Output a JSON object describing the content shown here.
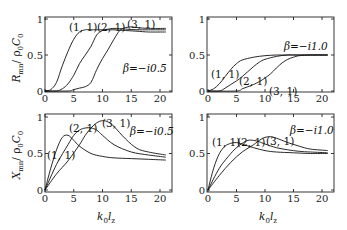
{
  "chart_data": [
    {
      "type": "line",
      "panel": "top-left",
      "ylabel": "R_mn / ρ0 C0",
      "xlabel": "",
      "annotation": "β=−i0.5",
      "xlim": [
        0,
        21
      ],
      "ylim": [
        0,
        1.05
      ],
      "xticks": [
        "0",
        "5",
        "10",
        "15",
        "20"
      ],
      "yticks": [
        "0",
        "0.5",
        "1"
      ],
      "series": [
        {
          "name": "(1, 1)",
          "x": [
            0,
            1,
            2,
            3,
            4,
            5,
            6,
            7,
            8,
            10,
            12,
            14,
            16,
            18,
            21
          ],
          "y": [
            0,
            0.02,
            0.12,
            0.35,
            0.55,
            0.72,
            0.82,
            0.85,
            0.85,
            0.85,
            0.85,
            0.84,
            0.83,
            0.82,
            0.82
          ]
        },
        {
          "name": "(2, 1)",
          "x": [
            0,
            2,
            3,
            4,
            5,
            6,
            7,
            8,
            9,
            10,
            11,
            12,
            14,
            16,
            18,
            21
          ],
          "y": [
            0,
            0,
            0.03,
            0.1,
            0.22,
            0.38,
            0.5,
            0.62,
            0.78,
            0.84,
            0.86,
            0.87,
            0.86,
            0.85,
            0.85,
            0.85
          ]
        },
        {
          "name": "(3, 1)",
          "x": [
            0,
            4,
            5,
            6,
            7,
            8,
            9,
            10,
            11,
            12,
            13,
            14,
            15,
            16,
            18,
            21
          ],
          "y": [
            0,
            0,
            0.02,
            0.04,
            0.06,
            0.12,
            0.3,
            0.45,
            0.58,
            0.72,
            0.84,
            0.88,
            0.89,
            0.88,
            0.87,
            0.87
          ]
        }
      ]
    },
    {
      "type": "line",
      "panel": "top-right",
      "ylabel": "",
      "xlabel": "",
      "annotation": "β=−i1.0",
      "xlim": [
        0,
        21
      ],
      "ylim": [
        0,
        1.05
      ],
      "xticks": [
        "0",
        "5",
        "10",
        "15",
        "20"
      ],
      "yticks": [
        "0",
        "0.5",
        "1"
      ],
      "series": [
        {
          "name": "(1, 1)",
          "x": [
            0,
            1,
            2,
            3,
            4,
            5,
            6,
            8,
            10,
            12,
            14,
            16,
            18,
            21
          ],
          "y": [
            0,
            0.03,
            0.1,
            0.2,
            0.3,
            0.38,
            0.43,
            0.47,
            0.49,
            0.5,
            0.5,
            0.5,
            0.5,
            0.5
          ]
        },
        {
          "name": "(2, 1)",
          "x": [
            0,
            2,
            3,
            4,
            5,
            6,
            7,
            8,
            9,
            10,
            12,
            14,
            16,
            21
          ],
          "y": [
            0,
            0,
            0.04,
            0.09,
            0.14,
            0.2,
            0.27,
            0.34,
            0.4,
            0.44,
            0.48,
            0.5,
            0.5,
            0.5
          ]
        },
        {
          "name": "(3, 1)",
          "x": [
            0,
            5,
            6,
            7,
            8,
            9,
            10,
            11,
            12,
            13,
            14,
            15,
            16,
            18,
            21
          ],
          "y": [
            0,
            0,
            0.03,
            0.06,
            0.09,
            0.13,
            0.18,
            0.24,
            0.32,
            0.39,
            0.44,
            0.47,
            0.49,
            0.5,
            0.5
          ]
        }
      ]
    },
    {
      "type": "line",
      "panel": "bottom-left",
      "ylabel": "X_mn / ρ0 C0",
      "xlabel": "k0 lz",
      "annotation": "β=−i0.5",
      "xlim": [
        0,
        21
      ],
      "ylim": [
        0,
        1.05
      ],
      "xticks": [
        "0",
        "5",
        "10",
        "15",
        "20"
      ],
      "yticks": [
        "0",
        "0.5",
        "1"
      ],
      "series": [
        {
          "name": "(1, 1)",
          "x": [
            0,
            1,
            2,
            3,
            4,
            5,
            6,
            8,
            10,
            12,
            15,
            18,
            21
          ],
          "y": [
            0,
            0.3,
            0.55,
            0.72,
            0.75,
            0.68,
            0.6,
            0.5,
            0.46,
            0.44,
            0.43,
            0.42,
            0.41
          ]
        },
        {
          "name": "(2, 1)",
          "x": [
            0,
            2,
            4,
            5,
            6,
            7,
            8,
            9,
            10,
            12,
            15,
            18,
            21
          ],
          "y": [
            0,
            0.35,
            0.62,
            0.75,
            0.82,
            0.85,
            0.85,
            0.82,
            0.75,
            0.62,
            0.52,
            0.48,
            0.45
          ]
        },
        {
          "name": "(3, 1)",
          "x": [
            0,
            2,
            4,
            6,
            7,
            8,
            9,
            10,
            11,
            12,
            14,
            16,
            18,
            21
          ],
          "y": [
            0,
            0.22,
            0.4,
            0.62,
            0.75,
            0.85,
            0.92,
            0.95,
            0.93,
            0.87,
            0.7,
            0.57,
            0.52,
            0.48
          ]
        }
      ]
    },
    {
      "type": "line",
      "panel": "bottom-right",
      "ylabel": "",
      "xlabel": "k0 lz",
      "annotation": "β=−i1.0",
      "xlim": [
        0,
        21
      ],
      "ylim": [
        0,
        1.05
      ],
      "xticks": [
        "0",
        "5",
        "10",
        "15",
        "20"
      ],
      "yticks": [
        "0",
        "0.5",
        "1"
      ],
      "series": [
        {
          "name": "(1, 1)",
          "x": [
            0,
            1,
            2,
            3,
            4,
            5,
            6,
            8,
            10,
            12,
            15,
            18,
            21
          ],
          "y": [
            0,
            0.3,
            0.5,
            0.6,
            0.64,
            0.65,
            0.63,
            0.58,
            0.54,
            0.52,
            0.51,
            0.5,
            0.5
          ]
        },
        {
          "name": "(2, 1)",
          "x": [
            0,
            2,
            4,
            5,
            6,
            7,
            8,
            9,
            10,
            12,
            14,
            16,
            18,
            21
          ],
          "y": [
            0,
            0.3,
            0.5,
            0.58,
            0.64,
            0.68,
            0.68,
            0.66,
            0.63,
            0.58,
            0.55,
            0.53,
            0.52,
            0.51
          ]
        },
        {
          "name": "(3, 1)",
          "x": [
            0,
            2,
            4,
            6,
            8,
            9,
            10,
            11,
            12,
            14,
            16,
            18,
            21
          ],
          "y": [
            0,
            0.2,
            0.38,
            0.52,
            0.62,
            0.68,
            0.72,
            0.73,
            0.71,
            0.65,
            0.6,
            0.56,
            0.54
          ]
        }
      ]
    }
  ],
  "labels": {
    "top_ylabel_main": "R",
    "top_ylabel_sub": "mn",
    "bottom_ylabel_main": "X",
    "bottom_ylabel_sub": "mn",
    "ylabel_denom": "/ ρ",
    "ylabel_denom_sub": "0",
    "ylabel_c": "C",
    "ylabel_c_sub": "0",
    "xlabel_k": "k",
    "xlabel_k_sub": "0",
    "xlabel_l": "l",
    "xlabel_l_sub": "z",
    "tl_ann": "β=−i0.5",
    "tr_ann": "β=−i1.0",
    "bl_ann": "β=−i0.5",
    "br_ann": "β=−i1.0",
    "m11": "(1, 1)",
    "m21": "(2, 1)",
    "m31": "(3, 1)"
  }
}
